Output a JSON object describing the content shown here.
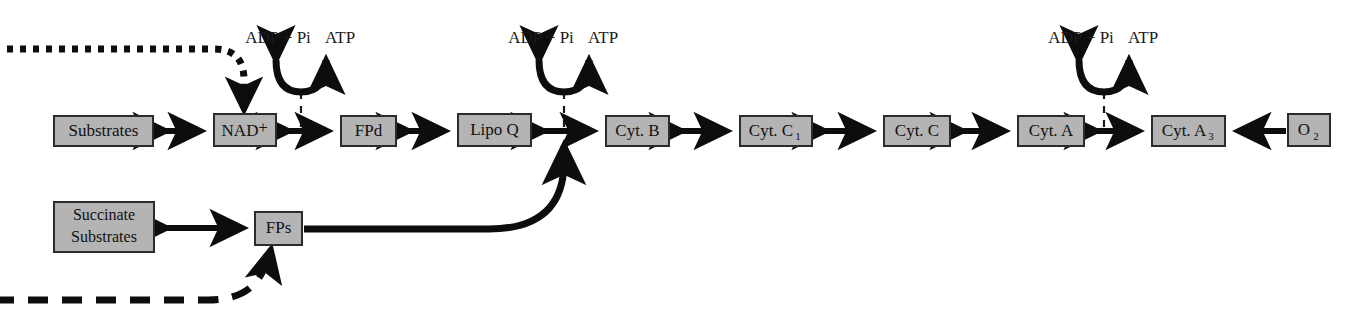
{
  "diagram": {
    "colors": {
      "box_fill": "#b4b4b4",
      "box_stroke": "#2b2b2b",
      "line": "#0d0d0d",
      "background": "#ffffff"
    },
    "main_chain": [
      {
        "id": "substrates",
        "label": "Substrates",
        "x": 54,
        "y": 116,
        "w": 99,
        "h": 30
      },
      {
        "id": "nad",
        "label": "NAD",
        "sup": "+",
        "x": 214,
        "y": 114,
        "w": 62,
        "h": 32
      },
      {
        "id": "fpd",
        "label": "FPd",
        "x": 341,
        "y": 116,
        "w": 55,
        "h": 30
      },
      {
        "id": "lipoq",
        "label": "Lipo Q",
        "x": 458,
        "y": 114,
        "w": 73,
        "h": 32
      },
      {
        "id": "cytb",
        "label": "Cyt. B",
        "x": 606,
        "y": 116,
        "w": 63,
        "h": 30
      },
      {
        "id": "cytc1",
        "label": "Cyt. C",
        "sub": "1",
        "x": 740,
        "y": 116,
        "w": 72,
        "h": 30
      },
      {
        "id": "cytc",
        "label": "Cyt. C",
        "x": 884,
        "y": 116,
        "w": 66,
        "h": 30
      },
      {
        "id": "cyta",
        "label": "Cyt. A",
        "x": 1018,
        "y": 116,
        "w": 66,
        "h": 30
      },
      {
        "id": "cyta3",
        "label": "Cyt. A",
        "sub": "3",
        "x": 1152,
        "y": 116,
        "w": 73,
        "h": 30
      },
      {
        "id": "o2",
        "label": "O",
        "sub": "2",
        "x": 1288,
        "y": 114,
        "w": 42,
        "h": 32
      }
    ],
    "lower_chain": [
      {
        "id": "succinate",
        "line1": "Succinate",
        "line2": "Substrates",
        "x": 54,
        "y": 202,
        "w": 100,
        "h": 50
      },
      {
        "id": "fps",
        "label": "FPs",
        "x": 255,
        "y": 212,
        "w": 47,
        "h": 33
      }
    ],
    "atp_sites": [
      {
        "id": "site1",
        "left_label": "ADP + Pi",
        "right_label": "ATP",
        "cx": 301,
        "label_y": 45
      },
      {
        "id": "site2",
        "left_label": "ADP + Pi",
        "right_label": "ATP",
        "cx": 564,
        "label_y": 45
      },
      {
        "id": "site3",
        "left_label": "ADP + Pi",
        "right_label": "ATP",
        "cx": 1104,
        "label_y": 45
      }
    ],
    "feeds": [
      {
        "id": "nadh-dotted-feed",
        "style": "dotted",
        "target": "nad"
      },
      {
        "id": "fadh-dashed-feed",
        "style": "dashed",
        "target": "fps"
      },
      {
        "id": "fps-to-chain-curve",
        "style": "solid-curve",
        "target": "main-chain-junction"
      }
    ]
  }
}
